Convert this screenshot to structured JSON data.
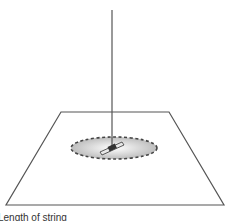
{
  "diagram": {
    "caption": "Length of string",
    "elements": {
      "string": "vertical string from top down to pendulum bob",
      "plane": "trapezoid surface (perspective plane)",
      "ellipse": "dashed elliptical path of motion on plane",
      "bob": "pendulum bob / object at center of ellipse"
    },
    "colors": {
      "line": "#555555",
      "ellipse_fill_center": "#ffffff",
      "ellipse_fill_edge": "#bdbdbd",
      "dash": "#444444"
    }
  }
}
